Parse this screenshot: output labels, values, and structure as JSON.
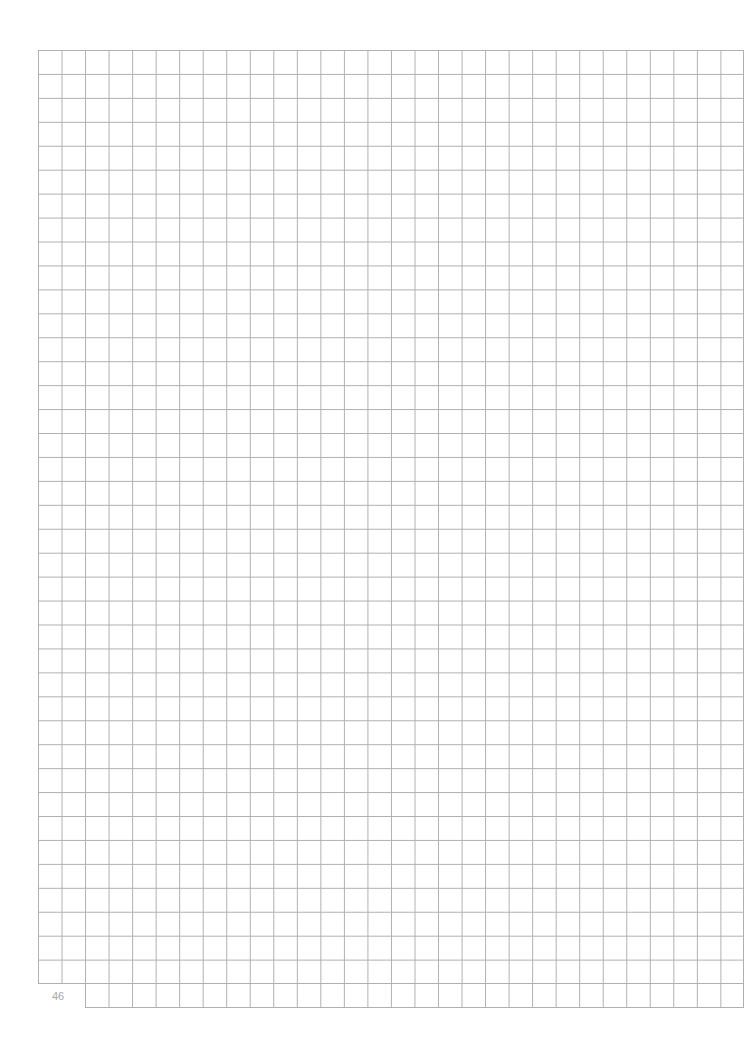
{
  "page": {
    "type": "grid-paper",
    "page_number": "46",
    "grid": {
      "columns": 30,
      "rows": 40,
      "last_row_offset_columns": 2,
      "line_color": "#b0b0b0"
    }
  }
}
